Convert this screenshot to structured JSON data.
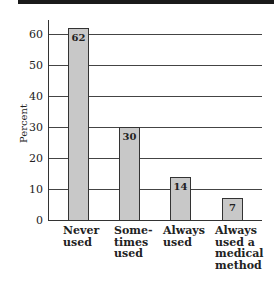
{
  "chart_data": {
    "type": "bar",
    "title": "",
    "xlabel": "",
    "ylabel": "Percent",
    "ylim": [
      0,
      60
    ],
    "yticks": [
      0,
      10,
      20,
      30,
      40,
      50,
      60
    ],
    "grid": true,
    "legend": null,
    "categories": [
      "Never used",
      "Some-times used",
      "Always used",
      "Always used a medical method"
    ],
    "category_lines": [
      [
        "Never",
        "used"
      ],
      [
        "Some-",
        "times",
        "used"
      ],
      [
        "Always",
        "used"
      ],
      [
        "Always",
        "used a",
        "medical",
        "method"
      ]
    ],
    "values": [
      62,
      30,
      14,
      7
    ],
    "value_labels": [
      "62",
      "30",
      "14",
      "7"
    ],
    "bar_color": "#c8c8c8"
  }
}
